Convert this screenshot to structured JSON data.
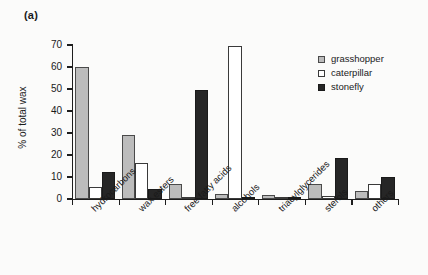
{
  "panel": {
    "label": "(a)"
  },
  "legend": {
    "position": "top-right",
    "entries": [
      {
        "name": "grasshopper",
        "swatch": "grasshopper",
        "color": "#bcbcbc"
      },
      {
        "name": "caterpillar",
        "swatch": "caterpillar",
        "color": "#ffffff"
      },
      {
        "name": "stonefly",
        "swatch": "stonefly",
        "color": "#262626"
      }
    ]
  },
  "axes": {
    "ylabel": "% of total wax",
    "xlabel": "",
    "yticks": [
      0,
      10,
      20,
      30,
      40,
      50,
      60,
      70
    ],
    "ylim": [
      0,
      70
    ],
    "grid": false
  },
  "chart_data": {
    "type": "bar",
    "title": "",
    "xlabel": "",
    "ylabel": "% of total wax",
    "ylim": [
      0,
      70
    ],
    "grid": false,
    "legend_position": "top-right",
    "categories": [
      "hydrocarbons",
      "wax esters",
      "free fatty acids",
      "alcohols",
      "triacylglycerides",
      "sterols",
      "others"
    ],
    "series": [
      {
        "name": "grasshopper",
        "color": "#bcbcbc",
        "values": [
          60,
          29,
          7,
          2.5,
          2,
          7,
          3.5
        ]
      },
      {
        "name": "caterpillar",
        "color": "#ffffff",
        "values": [
          5.5,
          16.3,
          1,
          69.5,
          0,
          1.5,
          7
        ]
      },
      {
        "name": "stonefly",
        "color": "#262626",
        "values": [
          12.5,
          4.5,
          49.5,
          0,
          0,
          18.5,
          10
        ]
      }
    ]
  }
}
